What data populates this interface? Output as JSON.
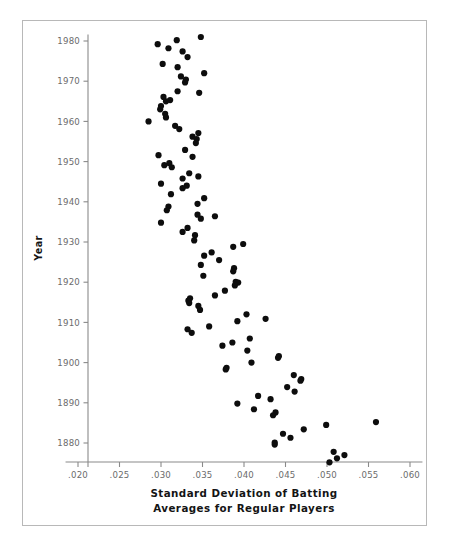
{
  "figure": {
    "background_color": "#ffffff",
    "frame_color": "#b8b8b8",
    "axis_color": "#8a8a8a",
    "point_color": "#0d0d0d"
  },
  "axis_titles": {
    "x_line1": "Standard Deviation of Batting",
    "x_line2": "Averages for Regular Players",
    "y": "Year"
  },
  "x_ticks": [
    ".020",
    ".025",
    ".030",
    ".035",
    ".040",
    ".045",
    ".050",
    ".055",
    ".060"
  ],
  "x_tick_values": [
    0.02,
    0.025,
    0.03,
    0.035,
    0.04,
    0.045,
    0.05,
    0.055,
    0.06
  ],
  "y_ticks": [
    "1880",
    "1890",
    "1900",
    "1910",
    "1920",
    "1930",
    "1940",
    "1950",
    "1960",
    "1970",
    "1980"
  ],
  "y_tick_values": [
    1880,
    1890,
    1900,
    1910,
    1920,
    1930,
    1940,
    1950,
    1960,
    1970,
    1980
  ],
  "chart_data": {
    "type": "scatter",
    "title": "",
    "xlabel": "Standard Deviation of Batting Averages for Regular Players",
    "ylabel": "Year",
    "xlim": [
      0.018,
      0.0615
    ],
    "ylim": [
      1873.5,
      1981.5
    ],
    "grid": false,
    "legend": null,
    "marker": "filled-circle",
    "marker_size_px": 3.1,
    "point_count": 107,
    "points": [
      {
        "x": 0.0348,
        "y": 1981.0
      },
      {
        "x": 0.0319,
        "y": 1980.2
      },
      {
        "x": 0.0296,
        "y": 1979.2
      },
      {
        "x": 0.0309,
        "y": 1978.2
      },
      {
        "x": 0.0326,
        "y": 1977.4
      },
      {
        "x": 0.0332,
        "y": 1976.0
      },
      {
        "x": 0.0302,
        "y": 1974.3
      },
      {
        "x": 0.032,
        "y": 1973.5
      },
      {
        "x": 0.0352,
        "y": 1972.0
      },
      {
        "x": 0.0324,
        "y": 1971.2
      },
      {
        "x": 0.033,
        "y": 1970.4
      },
      {
        "x": 0.0329,
        "y": 1969.7
      },
      {
        "x": 0.0346,
        "y": 1967.1
      },
      {
        "x": 0.032,
        "y": 1967.5
      },
      {
        "x": 0.0303,
        "y": 1966.1
      },
      {
        "x": 0.0311,
        "y": 1965.3
      },
      {
        "x": 0.0306,
        "y": 1965.0
      },
      {
        "x": 0.03,
        "y": 1963.8
      },
      {
        "x": 0.0299,
        "y": 1963.0
      },
      {
        "x": 0.0305,
        "y": 1961.9
      },
      {
        "x": 0.0306,
        "y": 1961.0
      },
      {
        "x": 0.0285,
        "y": 1960.0
      },
      {
        "x": 0.0317,
        "y": 1958.9
      },
      {
        "x": 0.0345,
        "y": 1957.1
      },
      {
        "x": 0.0322,
        "y": 1958.1
      },
      {
        "x": 0.0338,
        "y": 1956.2
      },
      {
        "x": 0.0343,
        "y": 1955.6
      },
      {
        "x": 0.0342,
        "y": 1954.6
      },
      {
        "x": 0.0329,
        "y": 1952.9
      },
      {
        "x": 0.0297,
        "y": 1951.6
      },
      {
        "x": 0.0338,
        "y": 1951.2
      },
      {
        "x": 0.0304,
        "y": 1949.1
      },
      {
        "x": 0.031,
        "y": 1949.6
      },
      {
        "x": 0.0313,
        "y": 1948.6
      },
      {
        "x": 0.0334,
        "y": 1947.1
      },
      {
        "x": 0.0345,
        "y": 1946.3
      },
      {
        "x": 0.0326,
        "y": 1945.8
      },
      {
        "x": 0.03,
        "y": 1944.5
      },
      {
        "x": 0.0331,
        "y": 1944.0
      },
      {
        "x": 0.0326,
        "y": 1943.4
      },
      {
        "x": 0.0312,
        "y": 1941.9
      },
      {
        "x": 0.0352,
        "y": 1940.9
      },
      {
        "x": 0.0344,
        "y": 1939.5
      },
      {
        "x": 0.0309,
        "y": 1938.8
      },
      {
        "x": 0.0307,
        "y": 1937.9
      },
      {
        "x": 0.0344,
        "y": 1936.8
      },
      {
        "x": 0.0348,
        "y": 1935.8
      },
      {
        "x": 0.0365,
        "y": 1936.4
      },
      {
        "x": 0.03,
        "y": 1934.8
      },
      {
        "x": 0.0332,
        "y": 1933.5
      },
      {
        "x": 0.0326,
        "y": 1932.5
      },
      {
        "x": 0.0341,
        "y": 1931.7
      },
      {
        "x": 0.034,
        "y": 1930.4
      },
      {
        "x": 0.0387,
        "y": 1928.8
      },
      {
        "x": 0.0399,
        "y": 1929.5
      },
      {
        "x": 0.0361,
        "y": 1927.4
      },
      {
        "x": 0.0352,
        "y": 1926.6
      },
      {
        "x": 0.037,
        "y": 1925.5
      },
      {
        "x": 0.0348,
        "y": 1924.3
      },
      {
        "x": 0.0388,
        "y": 1923.5
      },
      {
        "x": 0.0387,
        "y": 1922.7
      },
      {
        "x": 0.0351,
        "y": 1921.6
      },
      {
        "x": 0.039,
        "y": 1920.1
      },
      {
        "x": 0.0393,
        "y": 1919.9
      },
      {
        "x": 0.0389,
        "y": 1919.2
      },
      {
        "x": 0.0377,
        "y": 1917.9
      },
      {
        "x": 0.0365,
        "y": 1916.7
      },
      {
        "x": 0.0335,
        "y": 1916.0
      },
      {
        "x": 0.0333,
        "y": 1915.4
      },
      {
        "x": 0.0334,
        "y": 1914.8
      },
      {
        "x": 0.0345,
        "y": 1914.1
      },
      {
        "x": 0.0347,
        "y": 1913.1
      },
      {
        "x": 0.0403,
        "y": 1912.0
      },
      {
        "x": 0.0392,
        "y": 1910.3
      },
      {
        "x": 0.0426,
        "y": 1910.9
      },
      {
        "x": 0.0358,
        "y": 1909.0
      },
      {
        "x": 0.0332,
        "y": 1908.3
      },
      {
        "x": 0.0337,
        "y": 1907.4
      },
      {
        "x": 0.0407,
        "y": 1906.0
      },
      {
        "x": 0.0386,
        "y": 1905.0
      },
      {
        "x": 0.0374,
        "y": 1904.2
      },
      {
        "x": 0.0404,
        "y": 1903.0
      },
      {
        "x": 0.0442,
        "y": 1901.6
      },
      {
        "x": 0.0441,
        "y": 1901.2
      },
      {
        "x": 0.0409,
        "y": 1900.0
      },
      {
        "x": 0.0379,
        "y": 1898.7
      },
      {
        "x": 0.0378,
        "y": 1898.3
      },
      {
        "x": 0.046,
        "y": 1896.9
      },
      {
        "x": 0.0469,
        "y": 1895.9
      },
      {
        "x": 0.0468,
        "y": 1895.5
      },
      {
        "x": 0.0452,
        "y": 1893.9
      },
      {
        "x": 0.0461,
        "y": 1892.8
      },
      {
        "x": 0.0417,
        "y": 1891.7
      },
      {
        "x": 0.0432,
        "y": 1890.9
      },
      {
        "x": 0.0392,
        "y": 1889.8
      },
      {
        "x": 0.0412,
        "y": 1888.4
      },
      {
        "x": 0.0438,
        "y": 1887.6
      },
      {
        "x": 0.0435,
        "y": 1886.9
      },
      {
        "x": 0.0499,
        "y": 1884.5
      },
      {
        "x": 0.0559,
        "y": 1885.2
      },
      {
        "x": 0.0447,
        "y": 1882.3
      },
      {
        "x": 0.0472,
        "y": 1883.4
      },
      {
        "x": 0.0456,
        "y": 1881.3
      },
      {
        "x": 0.0437,
        "y": 1880.1
      },
      {
        "x": 0.0437,
        "y": 1879.6
      },
      {
        "x": 0.0508,
        "y": 1877.8
      },
      {
        "x": 0.0521,
        "y": 1877.0
      },
      {
        "x": 0.0512,
        "y": 1876.2
      },
      {
        "x": 0.0503,
        "y": 1875.2
      }
    ]
  }
}
